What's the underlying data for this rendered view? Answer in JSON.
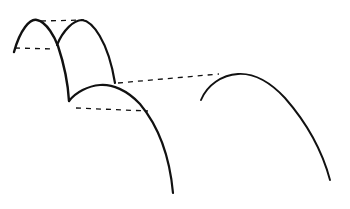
{
  "diagram": {
    "stroke_color": "#111111",
    "background": "#ffffff",
    "arches": [
      {
        "name": "arch-1",
        "path": "M14,52 C20,30 30,18 37,20 C47,22 55,38 58,46 C64,64 68,84 69,101",
        "width": 2.4
      },
      {
        "name": "arch-2",
        "path": "M57,45 C63,30 74,20 82,20 C92,21 108,40 115,83",
        "width": 2.2
      },
      {
        "name": "arch-3",
        "path": "M69,101 C76,92 88,86 100,85 C112,84 127,90 140,104 C160,128 170,160 173,193",
        "width": 2.2
      },
      {
        "name": "arch-4",
        "path": "M201,100 C207,85 222,75 238,74 C254,73 270,82 285,98 C306,122 322,150 330,180",
        "width": 1.9
      }
    ],
    "dashed_lines": [
      {
        "name": "dashed-line-top",
        "x1": 41,
        "y1": 21,
        "x2": 84,
        "y2": 20
      },
      {
        "name": "dashed-line-left",
        "x1": 15,
        "y1": 48,
        "x2": 54,
        "y2": 49
      },
      {
        "name": "dashed-line-long",
        "x1": 118,
        "y1": 83,
        "x2": 219,
        "y2": 74
      },
      {
        "name": "dashed-line-lower",
        "x1": 76,
        "y1": 108,
        "x2": 148,
        "y2": 111
      }
    ]
  }
}
